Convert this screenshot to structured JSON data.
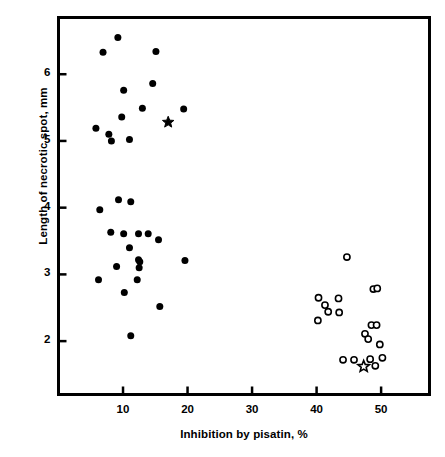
{
  "chart_data": {
    "type": "scatter",
    "title": "",
    "xlabel": "Inhibition by pisatin, %",
    "ylabel": "Length of necrotic spot, mm",
    "xlim": [
      0,
      57.5
    ],
    "ylim": [
      1.2,
      6.85
    ],
    "xticks": [
      10,
      20,
      30,
      40,
      50
    ],
    "yticks": [
      2,
      3,
      4,
      5,
      6
    ],
    "grid": false,
    "legend": "none",
    "series": [
      {
        "name": "filled-circles",
        "marker": "filled-circle",
        "color": "#000000",
        "points": [
          [
            9.2,
            6.55
          ],
          [
            6.9,
            6.33
          ],
          [
            15.1,
            6.34
          ],
          [
            10.1,
            5.76
          ],
          [
            14.6,
            5.86
          ],
          [
            13.0,
            5.49
          ],
          [
            19.4,
            5.48
          ],
          [
            9.8,
            5.36
          ],
          [
            5.8,
            5.19
          ],
          [
            7.8,
            5.1
          ],
          [
            8.2,
            5.0
          ],
          [
            11.0,
            5.02
          ],
          [
            9.3,
            4.12
          ],
          [
            11.2,
            4.09
          ],
          [
            6.4,
            3.97
          ],
          [
            8.1,
            3.63
          ],
          [
            10.1,
            3.61
          ],
          [
            12.4,
            3.61
          ],
          [
            13.9,
            3.61
          ],
          [
            15.5,
            3.52
          ],
          [
            11.0,
            3.4
          ],
          [
            19.6,
            3.21
          ],
          [
            12.4,
            3.22
          ],
          [
            12.6,
            3.19
          ],
          [
            9.0,
            3.12
          ],
          [
            12.5,
            3.1
          ],
          [
            6.2,
            2.92
          ],
          [
            12.2,
            2.92
          ],
          [
            10.2,
            2.73
          ],
          [
            15.7,
            2.52
          ],
          [
            11.2,
            2.08
          ]
        ]
      },
      {
        "name": "open-circles",
        "marker": "open-circle",
        "color": "#000000",
        "points": [
          [
            44.7,
            3.26
          ],
          [
            48.8,
            2.78
          ],
          [
            49.4,
            2.79
          ],
          [
            40.3,
            2.65
          ],
          [
            43.4,
            2.64
          ],
          [
            41.3,
            2.54
          ],
          [
            41.8,
            2.44
          ],
          [
            43.5,
            2.43
          ],
          [
            40.2,
            2.31
          ],
          [
            48.5,
            2.24
          ],
          [
            49.3,
            2.24
          ],
          [
            47.5,
            2.11
          ],
          [
            48.0,
            2.03
          ],
          [
            49.8,
            1.95
          ],
          [
            44.1,
            1.72
          ],
          [
            45.8,
            1.72
          ],
          [
            48.3,
            1.73
          ],
          [
            50.2,
            1.75
          ],
          [
            49.1,
            1.63
          ]
        ]
      },
      {
        "name": "filled-star",
        "marker": "filled-star",
        "color": "#000000",
        "points": [
          [
            17.0,
            5.28
          ]
        ]
      },
      {
        "name": "open-star",
        "marker": "open-star",
        "color": "#000000",
        "points": [
          [
            47.3,
            1.62
          ]
        ]
      }
    ]
  },
  "axes": {
    "x_tick_labels": [
      "10",
      "20",
      "30",
      "40",
      "50"
    ],
    "y_tick_labels": [
      "2",
      "3",
      "4",
      "5",
      "6"
    ]
  }
}
